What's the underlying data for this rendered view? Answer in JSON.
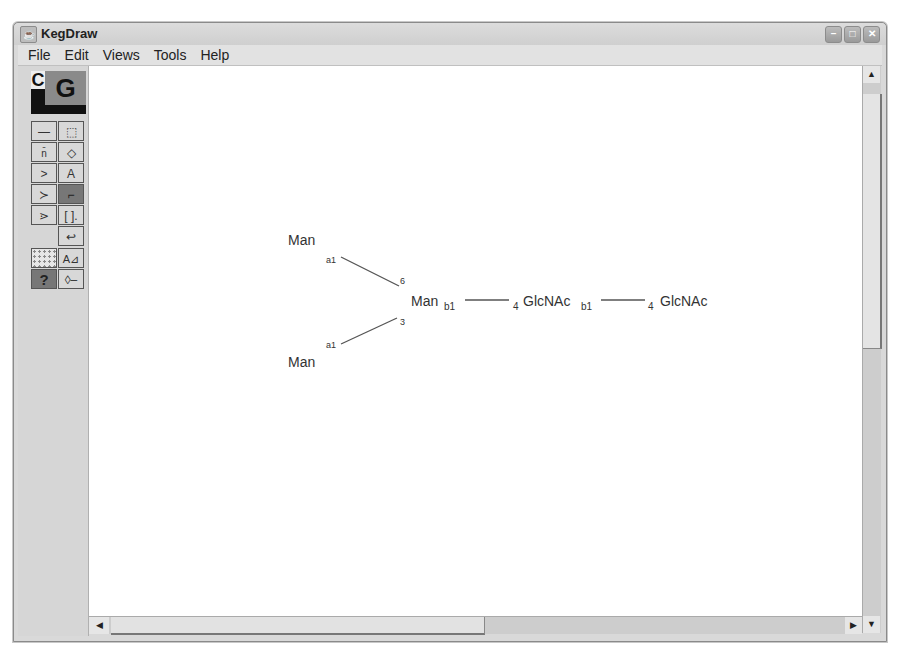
{
  "window": {
    "title": "KegDraw",
    "controls": [
      "minimize",
      "maximize",
      "close"
    ]
  },
  "menu": [
    "File",
    "Edit",
    "Views",
    "Tools",
    "Help"
  ],
  "toolbox": {
    "mode_c": "C",
    "mode_g": "G",
    "tools": [
      {
        "name": "single-bond-icon",
        "glyph": "—"
      },
      {
        "name": "select-icon",
        "glyph": "⬚"
      },
      {
        "name": "n-bond-icon",
        "glyph": "n"
      },
      {
        "name": "eraser-icon",
        "glyph": "◇"
      },
      {
        "name": "branch-icon",
        "glyph": ">"
      },
      {
        "name": "text-icon",
        "glyph": "A"
      },
      {
        "name": "double-branch-icon",
        "glyph": "≻"
      },
      {
        "name": "bracket-bond-icon",
        "glyph": "⌐"
      },
      {
        "name": "triple-branch-icon",
        "glyph": "⋗"
      },
      {
        "name": "repeat-bracket-icon",
        "glyph": "[ ]"
      },
      {
        "name": "undo-icon",
        "glyph": "↩"
      }
    ],
    "tools2": [
      {
        "name": "grid-icon",
        "glyph": ""
      },
      {
        "name": "align-icon",
        "glyph": "A⊿"
      },
      {
        "name": "help-icon",
        "glyph": "?"
      },
      {
        "name": "reducing-end-icon",
        "glyph": "◊—"
      }
    ]
  },
  "glycan": {
    "nodes": [
      {
        "id": "man_top",
        "label": "Man"
      },
      {
        "id": "man_bottom",
        "label": "Man"
      },
      {
        "id": "man_core",
        "label": "Man",
        "sub": "b1"
      },
      {
        "id": "glcnac1",
        "label": "GlcNAc",
        "sub": "b1"
      },
      {
        "id": "glcnac2",
        "label": "GlcNAc"
      }
    ],
    "links": [
      {
        "from": "man_top",
        "to": "man_core",
        "anomer": "a1",
        "position": "6"
      },
      {
        "from": "man_bottom",
        "to": "man_core",
        "anomer": "a1",
        "position": "3"
      },
      {
        "from": "man_core",
        "to": "glcnac1",
        "anomer": "b1",
        "position": "4"
      },
      {
        "from": "glcnac1",
        "to": "glcnac2",
        "anomer": "b1",
        "position": "4"
      }
    ]
  }
}
